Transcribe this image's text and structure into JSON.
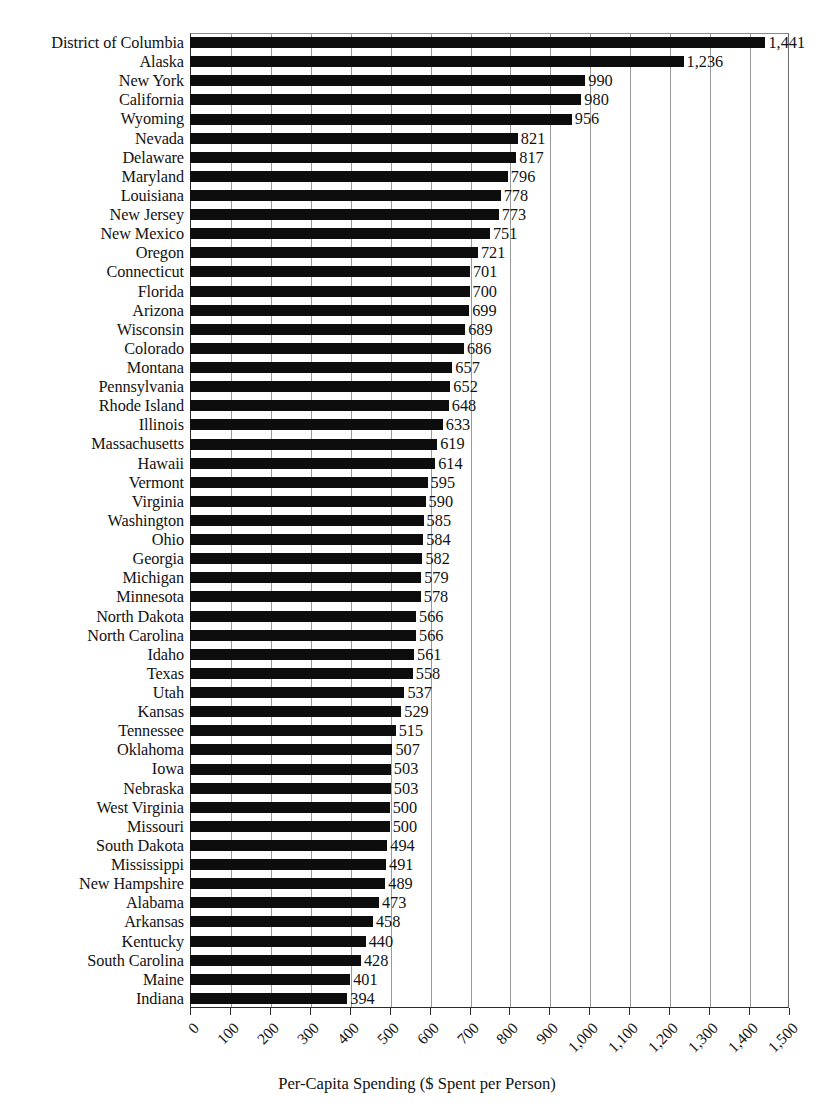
{
  "chart_data": {
    "type": "bar",
    "orientation": "horizontal",
    "title": "",
    "xlabel": "Per-Capita Spending ($ Spent per Person)",
    "ylabel": "",
    "xlim": [
      0,
      1500
    ],
    "xticks": [
      0,
      100,
      200,
      300,
      400,
      500,
      600,
      700,
      800,
      900,
      1000,
      1100,
      1200,
      1300,
      1400,
      1500
    ],
    "xtick_labels": [
      "0",
      "100",
      "200",
      "300",
      "400",
      "500",
      "600",
      "700",
      "800",
      "900",
      "1,000",
      "1,100",
      "1,200",
      "1,300",
      "1,400",
      "1,500"
    ],
    "grid": "vertical",
    "legend": "none",
    "bar_color": "#0d0d0d",
    "grid_color": "#9a9a9a",
    "categories": [
      "District of Columbia",
      "Alaska",
      "New York",
      "California",
      "Wyoming",
      "Nevada",
      "Delaware",
      "Maryland",
      "Louisiana",
      "New Jersey",
      "New Mexico",
      "Oregon",
      "Connecticut",
      "Florida",
      "Arizona",
      "Wisconsin",
      "Colorado",
      "Montana",
      "Pennsylvania",
      "Rhode Island",
      "Illinois",
      "Massachusetts",
      "Hawaii",
      "Vermont",
      "Virginia",
      "Washington",
      "Ohio",
      "Georgia",
      "Michigan",
      "Minnesota",
      "North Dakota",
      "North Carolina",
      "Idaho",
      "Texas",
      "Utah",
      "Kansas",
      "Tennessee",
      "Oklahoma",
      "Iowa",
      "Nebraska",
      "West Virginia",
      "Missouri",
      "South Dakota",
      "Mississippi",
      "New Hampshire",
      "Alabama",
      "Arkansas",
      "Kentucky",
      "South Carolina",
      "Maine",
      "Indiana"
    ],
    "values": [
      1441,
      1236,
      990,
      980,
      956,
      821,
      817,
      796,
      778,
      773,
      751,
      721,
      701,
      700,
      699,
      689,
      686,
      657,
      652,
      648,
      633,
      619,
      614,
      595,
      590,
      585,
      584,
      582,
      579,
      578,
      566,
      566,
      561,
      558,
      537,
      529,
      515,
      507,
      503,
      503,
      500,
      500,
      494,
      491,
      489,
      473,
      458,
      440,
      428,
      401,
      394
    ],
    "value_labels": [
      "1,441",
      "1,236",
      "990",
      "980",
      "956",
      "821",
      "817",
      "796",
      "778",
      "773",
      "751",
      "721",
      "701",
      "700",
      "699",
      "689",
      "686",
      "657",
      "652",
      "648",
      "633",
      "619",
      "614",
      "595",
      "590",
      "585",
      "584",
      "582",
      "579",
      "578",
      "566",
      "566",
      "561",
      "558",
      "537",
      "529",
      "515",
      "507",
      "503",
      "503",
      "500",
      "500",
      "494",
      "491",
      "489",
      "473",
      "458",
      "440",
      "428",
      "401",
      "394"
    ]
  }
}
